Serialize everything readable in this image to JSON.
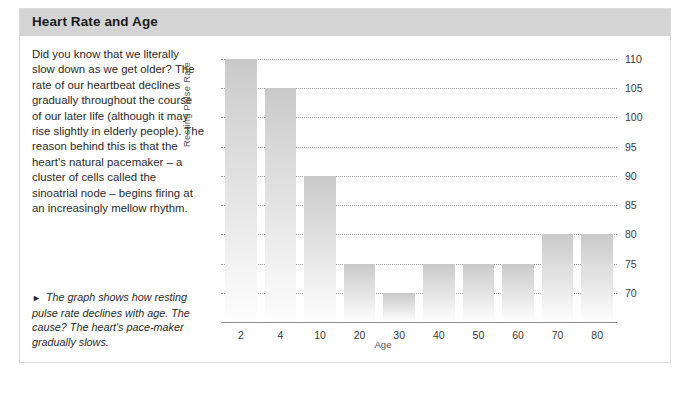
{
  "panel": {
    "title": "Heart Rate and Age"
  },
  "article": {
    "body": "Did you know that we literally slow down as we get older? The rate of our heartbeat declines gradually throughout the course of our later life (although it may rise slightly in elderly people). The reason behind this is that the heart's natural pacemaker – a cluster of cells called the sinoatrial node – begins firing at an increasingly mellow rhythm.",
    "caption_marker": "►",
    "caption": "The graph shows how resting pulse rate declines with age. The cause? The heart's pace-maker gradually slows."
  },
  "chart_data": {
    "type": "bar",
    "title": "",
    "xlabel": "Age",
    "ylabel": "Resting Pulse Rate",
    "categories": [
      "2",
      "4",
      "10",
      "20",
      "30",
      "40",
      "50",
      "60",
      "70",
      "80"
    ],
    "values": [
      110,
      105,
      90,
      75,
      70,
      75,
      75,
      75,
      80,
      80
    ],
    "ylim": [
      65,
      110
    ],
    "yticks": [
      110,
      105,
      100,
      95,
      90,
      85,
      80,
      75,
      70
    ],
    "ytick_labels": [
      "110",
      "105",
      "100",
      "95",
      "90",
      "85",
      "80",
      "75",
      "70"
    ],
    "grid": true,
    "grid_style": "dotted",
    "legend": "none",
    "bar_color": "#d4d4d4",
    "accent_color": "#d4d4d4"
  },
  "colors": {
    "header_band": "#d4d4d4",
    "panel_border": "#dcdcdc",
    "text": "#2a2a2a",
    "axis": "#8c8c8c"
  }
}
